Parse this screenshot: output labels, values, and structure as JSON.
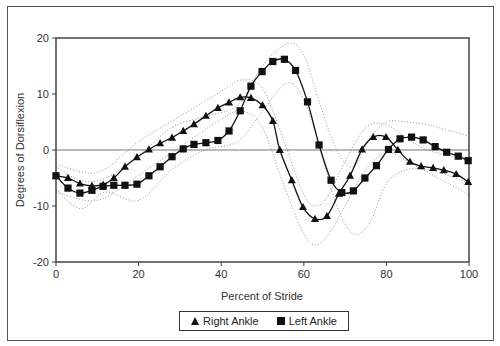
{
  "chart_data": {
    "type": "line",
    "title": "",
    "xlabel": "Percent of Stride",
    "ylabel": "Degrees of Dorsiflexion",
    "xlim": [
      0,
      100
    ],
    "ylim": [
      -20,
      20
    ],
    "xticks": [
      0,
      20,
      40,
      60,
      80,
      100
    ],
    "yticks": [
      -20,
      -10,
      0,
      10,
      20
    ],
    "grid": false,
    "zero_line": true,
    "legend_position": "bottom",
    "series": [
      {
        "name": "Right Ankle",
        "marker": "triangle",
        "color": "#111111",
        "x": [
          0,
          2.9,
          5.8,
          8.7,
          11.4,
          14.0,
          16.7,
          19.6,
          22.5,
          25.2,
          28.1,
          30.8,
          33.4,
          36.3,
          39.2,
          41.9,
          44.6,
          47.2,
          50.0,
          52.5,
          54.2,
          57.1,
          59.8,
          62.7,
          65.6,
          68.5,
          71.2,
          74.1,
          76.8,
          79.9,
          82.8,
          85.7,
          88.4,
          91.3,
          93.9,
          96.9,
          99.8
        ],
        "values": [
          -4.6,
          -5.0,
          -6.0,
          -6.4,
          -6.2,
          -5.0,
          -3.0,
          -1.3,
          0.1,
          1.2,
          2.2,
          3.4,
          4.6,
          6.1,
          7.5,
          8.5,
          9.4,
          9.3,
          8.0,
          5.2,
          0.0,
          -5.4,
          -10.2,
          -12.3,
          -11.8,
          -7.8,
          -4.6,
          0.1,
          2.3,
          2.3,
          0.0,
          -2.1,
          -2.9,
          -3.2,
          -3.6,
          -4.3,
          -5.7
        ]
      },
      {
        "name": "Left Ankle",
        "marker": "square",
        "color": "#111111",
        "x": [
          0,
          2.9,
          5.8,
          8.7,
          11.4,
          14.0,
          16.7,
          19.6,
          22.5,
          25.2,
          28.1,
          30.8,
          33.4,
          36.3,
          39.2,
          41.9,
          44.6,
          47.2,
          49.9,
          52.5,
          55.3,
          58.0,
          60.9,
          63.7,
          66.6,
          69.2,
          72.0,
          74.8,
          77.6,
          80.5,
          83.3,
          86.1,
          88.9,
          91.8,
          94.6,
          97.4,
          99.8
        ],
        "values": [
          -4.6,
          -6.8,
          -7.7,
          -7.2,
          -6.5,
          -6.3,
          -6.3,
          -6.1,
          -4.6,
          -3.0,
          -1.2,
          0.2,
          1.0,
          1.3,
          1.7,
          3.4,
          7.0,
          11.4,
          14.0,
          15.8,
          16.2,
          14.2,
          8.6,
          0.9,
          -5.4,
          -7.6,
          -7.3,
          -5.0,
          -2.8,
          0.1,
          2.0,
          2.3,
          1.8,
          0.6,
          -0.4,
          -1.1,
          -1.9
        ]
      }
    ],
    "bands": [
      {
        "name": "Right Ankle normal range",
        "style": "dotted",
        "x": [
          0,
          10,
          20,
          30,
          40,
          45,
          50,
          55,
          60,
          63,
          66,
          70,
          75,
          80,
          85,
          90,
          95,
          100
        ],
        "upper": [
          -2.5,
          -4.0,
          1.5,
          6.0,
          10.5,
          12.5,
          11.0,
          2.0,
          -8.0,
          -10.0,
          -8.0,
          -2.0,
          4.0,
          4.5,
          2.0,
          0.0,
          -1.0,
          -2.0
        ],
        "lower": [
          -7.5,
          -9.0,
          -4.5,
          0.5,
          5.5,
          7.0,
          4.0,
          -6.0,
          -15.0,
          -17.0,
          -15.0,
          -10.0,
          -3.5,
          -0.5,
          -2.0,
          -4.0,
          -6.0,
          -8.0
        ]
      },
      {
        "name": "Left Ankle normal range",
        "style": "dotted",
        "x": [
          0,
          6,
          12,
          20,
          28,
          36,
          44,
          50,
          56,
          60,
          64,
          68,
          72,
          76,
          80,
          85,
          90,
          95,
          100
        ],
        "upper": [
          -3.0,
          -5.5,
          -5.0,
          -1.0,
          4.0,
          6.0,
          8.0,
          15.0,
          19.0,
          17.0,
          8.0,
          0.0,
          -3.0,
          2.0,
          5.0,
          5.0,
          4.5,
          3.5,
          2.5
        ],
        "lower": [
          -7.0,
          -10.5,
          -7.5,
          -9.0,
          -3.5,
          0.0,
          1.5,
          7.0,
          12.0,
          9.0,
          0.0,
          -10.0,
          -15.0,
          -13.0,
          -6.0,
          -3.5,
          -3.5,
          -4.5,
          -6.0
        ]
      }
    ]
  },
  "legend": {
    "items": [
      {
        "label": "Right Ankle",
        "icon": "triangle-marker-icon"
      },
      {
        "label": "Left Ankle",
        "icon": "square-marker-icon"
      }
    ]
  }
}
